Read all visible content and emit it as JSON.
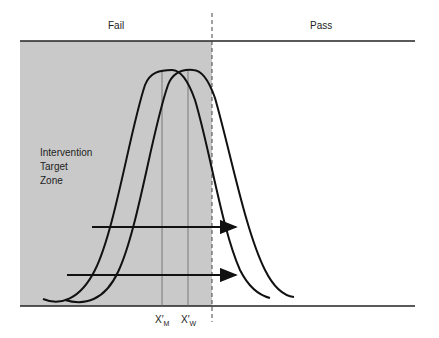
{
  "header": {
    "fail_label": "Fail",
    "pass_label": "Pass"
  },
  "zone_label": {
    "line1": "Intervention",
    "line2": "Target",
    "line3": "Zone"
  },
  "markers": {
    "m_label": "X",
    "m_sub": "M",
    "w_label": "X",
    "w_sub": "W",
    "prime": "′"
  },
  "colors": {
    "fail_zone_fill": "#c9c9c9",
    "curve": "#111111",
    "axis": "#222222"
  }
}
